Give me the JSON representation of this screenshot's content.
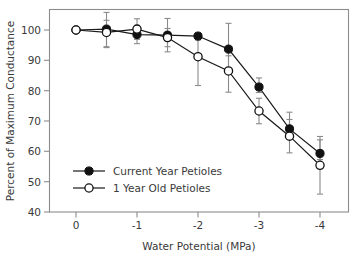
{
  "chart_data": {
    "type": "line",
    "title": "",
    "xlabel": "Water Potential (MPa)",
    "ylabel": "Percent of Maximum Conductance",
    "xlim": [
      0.55,
      -4.55
    ],
    "ylim": [
      40,
      100
    ],
    "xticks": [
      0,
      -1,
      -2,
      -3,
      -4
    ],
    "xticklabels": [
      "0",
      "-1",
      "-2",
      "-3",
      "-4"
    ],
    "yticks": [
      40,
      50,
      60,
      70,
      80,
      90,
      100
    ],
    "yticklabels": [
      "40",
      "50",
      "60",
      "70",
      "80",
      "90",
      "100"
    ],
    "grid": false,
    "legend_position": "lower-left-inside",
    "x": [
      0,
      -0.5,
      -1,
      -1.5,
      -2,
      -2.5,
      -3,
      -3.5,
      -4
    ],
    "series": [
      {
        "name": "Current Year Petioles",
        "marker": "filled-circle",
        "color": "#111111",
        "values": [
          100.0,
          100.3,
          98.5,
          98.3,
          98.0,
          93.7,
          81.2,
          67.4,
          59.3
        ],
        "err_low": [
          0.0,
          5.8,
          3.0,
          5.5,
          0.0,
          8.0,
          1.8,
          3.5,
          2.0
        ],
        "err_high": [
          0.0,
          5.5,
          3.0,
          5.5,
          0.0,
          8.5,
          3.0,
          5.5,
          4.5
        ]
      },
      {
        "name": "1 Year Old Petioles",
        "marker": "open-circle",
        "color": "#111111",
        "values": [
          100.0,
          99.2,
          100.3,
          97.5,
          91.2,
          86.5,
          73.3,
          65.0,
          55.4
        ],
        "err_low": [
          0.0,
          5.0,
          3.4,
          3.0,
          9.5,
          7.0,
          4.2,
          5.5,
          9.5
        ],
        "err_high": [
          0.0,
          4.0,
          3.4,
          3.0,
          5.5,
          5.0,
          4.2,
          5.5,
          9.5
        ]
      }
    ]
  },
  "axes": {
    "xlabel": "Water Potential (MPa)",
    "ylabel": "Percent of Maximum Conductance"
  },
  "legend": {
    "items": [
      {
        "label": "Current Year Petioles"
      },
      {
        "label": "1 Year Old Petioles"
      }
    ]
  },
  "ticks": {
    "x": [
      "0",
      "-1",
      "-2",
      "-3",
      "-4"
    ],
    "y": [
      "100",
      "90",
      "80",
      "70",
      "60",
      "50",
      "40"
    ]
  },
  "colors": {
    "frame": "#8c8c8c",
    "line": "#1a1a1a",
    "error": "#8a8a8a",
    "text": "#3a3a3a",
    "background": "#ffffff"
  }
}
